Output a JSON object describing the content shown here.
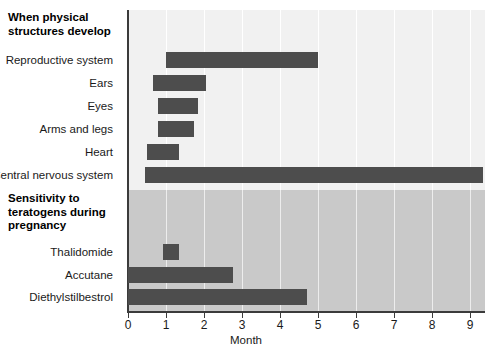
{
  "chart_data": {
    "type": "bar",
    "orientation": "horizontal",
    "title": "",
    "xlabel": "Month",
    "ylabel": "",
    "xlim": [
      0,
      9.4
    ],
    "xticks": [
      0,
      1,
      2,
      3,
      4,
      5,
      6,
      7,
      8,
      9
    ],
    "xtick_labels": [
      "0",
      "1",
      "2",
      "3",
      "4",
      "5",
      "6",
      "7",
      "8",
      "9"
    ],
    "grid": "vertical",
    "legend": "none",
    "bar_color": "#4d4d4d",
    "sections": [
      {
        "heading": "When physical structures develop",
        "background": "#f1f1f1",
        "bars": [
          {
            "label": "Reproductive system",
            "start": 1.0,
            "end": 5.0
          },
          {
            "label": "Ears",
            "start": 0.65,
            "end": 2.05
          },
          {
            "label": "Eyes",
            "start": 0.78,
            "end": 1.85
          },
          {
            "label": "Arms and legs",
            "start": 0.78,
            "end": 1.75
          },
          {
            "label": "Heart",
            "start": 0.5,
            "end": 1.35
          },
          {
            "label": "Central nervous system",
            "start": 0.45,
            "end": 9.35
          }
        ]
      },
      {
        "heading": "Sensitivity to teratogens during pregnancy",
        "background": "#c9c9c9",
        "bars": [
          {
            "label": "Thalidomide",
            "start": 0.92,
            "end": 1.35
          },
          {
            "label": "Accutane",
            "start": 0.0,
            "end": 2.75
          },
          {
            "label": "Diethylstilbestrol",
            "start": 0.0,
            "end": 4.7
          }
        ]
      }
    ]
  },
  "axis": {
    "x_title": "Month"
  },
  "headings": {
    "line_0_a": "When physical",
    "line_0_b": "structures develop",
    "line_1_a": "Sensitivity to",
    "line_1_b": "teratogens during",
    "line_1_c": "pregnancy"
  }
}
